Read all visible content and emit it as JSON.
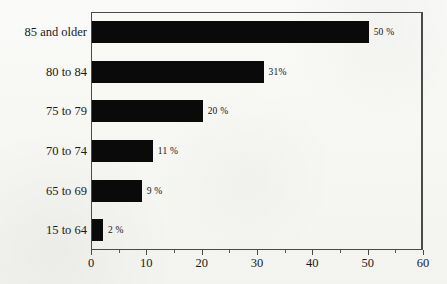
{
  "chart_data": {
    "type": "bar",
    "orientation": "horizontal",
    "title": "",
    "subtitle": "",
    "xlabel": "",
    "ylabel": "",
    "categories": [
      "15 to 64",
      "65 to 69",
      "70 to 74",
      "75 to 79",
      "80 to 84",
      "85 and older"
    ],
    "values": [
      2,
      9,
      11,
      20,
      31,
      50
    ],
    "value_labels": [
      "2 %",
      "9 %",
      "11 %",
      "20 %",
      "31%",
      "50 %"
    ],
    "xlim": [
      0,
      60
    ],
    "xticks": [
      0,
      10,
      20,
      30,
      40,
      50,
      60
    ],
    "xtick_labels": [
      "0",
      "10",
      "20",
      "30",
      "40",
      "50",
      "60"
    ],
    "xminor_ticks": [
      5,
      15,
      25,
      35,
      45,
      55
    ],
    "grid": false,
    "legend": null,
    "bar_color": "#0a0a0a",
    "background_color": "#f7f7f5",
    "axis_color": "#4a4a4a",
    "annotations": []
  },
  "rows": [
    {
      "label": "85 and older",
      "value": 50,
      "value_label": "50 %"
    },
    {
      "label": "80 to 84",
      "value": 31,
      "value_label": "31%"
    },
    {
      "label": "75 to 79",
      "value": 20,
      "value_label": "20 %"
    },
    {
      "label": "70 to 74",
      "value": 11,
      "value_label": "11 %"
    },
    {
      "label": "65 to 69",
      "value": 9,
      "value_label": "9 %"
    },
    {
      "label": "15 to 64",
      "value": 2,
      "value_label": "2 %"
    }
  ],
  "axis": {
    "ticks": [
      {
        "value": 0,
        "label": "0"
      },
      {
        "value": 10,
        "label": "10"
      },
      {
        "value": 20,
        "label": "20"
      },
      {
        "value": 30,
        "label": "30"
      },
      {
        "value": 40,
        "label": "40"
      },
      {
        "value": 50,
        "label": "50"
      },
      {
        "value": 60,
        "label": "60"
      }
    ],
    "minor_ticks": [
      5,
      15,
      25,
      35,
      45,
      55
    ],
    "max": 60
  }
}
